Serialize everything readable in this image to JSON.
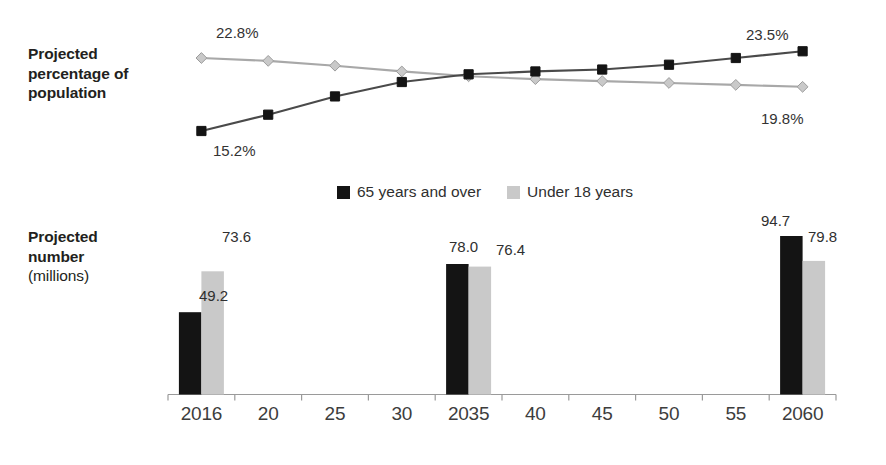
{
  "figure": {
    "pct_axis_title_bold": "Projected\npercentage of\npopulation",
    "num_axis_title_bold": "Projected\nnumber",
    "num_axis_title_light": "(millions)"
  },
  "legend": {
    "position": "bottom-center-between-panels",
    "entries": [
      {
        "label": "65 years and over",
        "color": "#141414",
        "marker": "square"
      },
      {
        "label": "Under 18 years",
        "color": "#c9c9c9",
        "marker": "diamond"
      }
    ]
  },
  "chart_data": [
    {
      "type": "line",
      "title": "Projected percentage of population",
      "xlabel": "",
      "ylabel": "Projected percentage of population",
      "grid": false,
      "legend_position": "below-plot",
      "categories": [
        "2016",
        "20",
        "25",
        "30",
        "2035",
        "40",
        "45",
        "50",
        "55",
        "2060"
      ],
      "ylim": [
        14,
        24.5
      ],
      "series": [
        {
          "name": "65 years and over",
          "color": "#141414",
          "marker": "square",
          "values": [
            15.2,
            16.9,
            18.8,
            20.3,
            21.1,
            21.4,
            21.6,
            22.1,
            22.8,
            23.5
          ],
          "labels": {
            "first": "15.2%",
            "last": "23.5%"
          }
        },
        {
          "name": "Under 18 years",
          "color": "#c9c9c9",
          "marker": "diamond",
          "values": [
            22.8,
            22.5,
            22.0,
            21.4,
            20.9,
            20.6,
            20.4,
            20.2,
            20.0,
            19.8
          ],
          "labels": {
            "first": "22.8%",
            "last": "19.8%"
          }
        }
      ]
    },
    {
      "type": "bar",
      "title": "Projected number (millions)",
      "xlabel": "",
      "ylabel": "Projected number (millions)",
      "grid": false,
      "legend_position": "above-plot",
      "categories": [
        "2016",
        "20",
        "25",
        "30",
        "2035",
        "40",
        "45",
        "50",
        "55",
        "2060"
      ],
      "bar_categories": [
        "2016",
        "2035",
        "2060"
      ],
      "ylim": [
        0,
        100
      ],
      "series": [
        {
          "name": "65 years and over",
          "color": "#141414",
          "values": [
            49.2,
            78.0,
            94.7
          ]
        },
        {
          "name": "Under 18 years",
          "color": "#c9c9c9",
          "values": [
            73.6,
            76.4,
            79.8
          ]
        }
      ]
    }
  ],
  "labels": {
    "pct_first_over65": "15.2%",
    "pct_last_over65": "23.5%",
    "pct_first_under18": "22.8%",
    "pct_last_under18": "19.8%",
    "bar_2016_over65": "49.2",
    "bar_2016_under18": "73.6",
    "bar_2035_over65": "78.0",
    "bar_2035_under18": "76.4",
    "bar_2060_over65": "94.7",
    "bar_2060_under18": "79.8"
  },
  "ticks": {
    "t0": "2016",
    "t1": "20",
    "t2": "25",
    "t3": "30",
    "t4": "2035",
    "t5": "40",
    "t6": "45",
    "t7": "50",
    "t8": "55",
    "t9": "2060"
  }
}
